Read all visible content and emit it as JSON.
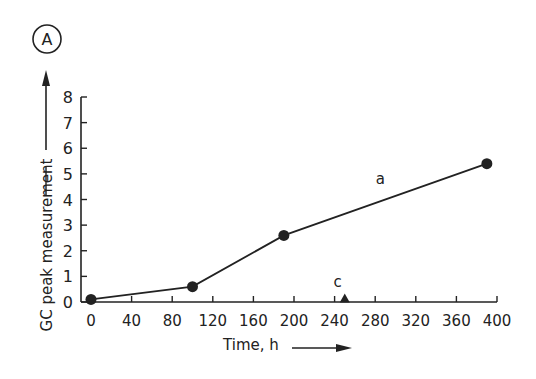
{
  "panel_label": "A",
  "chart_data": {
    "type": "line",
    "title": "",
    "xlabel": "Time, h",
    "ylabel": "GC peak measurement",
    "xlim": [
      0,
      400
    ],
    "ylim": [
      0,
      8
    ],
    "xticks": [
      0,
      40,
      80,
      120,
      160,
      200,
      240,
      280,
      320,
      360,
      400
    ],
    "yticks": [
      0,
      1,
      2,
      3,
      4,
      5,
      6,
      7,
      8
    ],
    "grid": false,
    "legend": "none",
    "series": [
      {
        "name": "a",
        "marker": "circle",
        "x": [
          0,
          100,
          190,
          390
        ],
        "y": [
          0.1,
          0.6,
          2.6,
          5.4
        ]
      },
      {
        "name": "c",
        "marker": "triangle",
        "x": [
          250
        ],
        "y": [
          0.1
        ]
      }
    ],
    "annotations": [
      {
        "text": "a",
        "x": 285,
        "y": 4.6
      },
      {
        "text": "c",
        "x": 243,
        "y": 0.6
      }
    ]
  },
  "colors": {
    "ink": "#222222",
    "background": "#ffffff"
  }
}
